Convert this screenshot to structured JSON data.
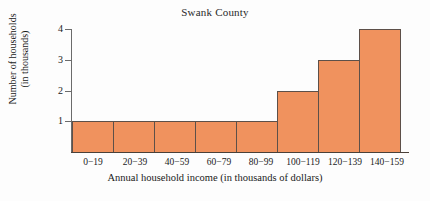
{
  "chart_data": {
    "type": "bar",
    "title": "Swank County",
    "xlabel": "Annual household income (in thousands of dollars)",
    "ylabel_line1": "Number of households",
    "ylabel_line2": "(in thousands)",
    "categories": [
      "0−19",
      "20−39",
      "40−59",
      "60−79",
      "80−99",
      "100−119",
      "120−139",
      "140−159"
    ],
    "values": [
      1,
      1,
      1,
      1,
      1,
      2,
      3,
      4
    ],
    "ylim": [
      0,
      4
    ],
    "yticks": [
      "1",
      "2",
      "3",
      "4"
    ],
    "ytick_values": [
      1,
      2,
      3,
      4
    ],
    "grid": false,
    "legend": false,
    "bar_fill_color": "#f0925e",
    "bar_edge_color": "#5d5049",
    "axis_color": "#4a4038",
    "background_color": "#fdfdfd"
  }
}
